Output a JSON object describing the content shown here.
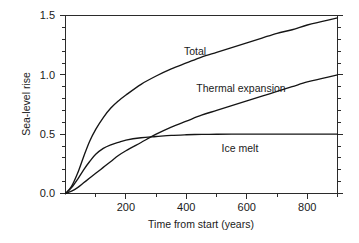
{
  "chart_data": {
    "type": "line",
    "title": "",
    "xlabel": "Time from start (years)",
    "ylabel": "Sea-level rise",
    "xlim": [
      0,
      900
    ],
    "ylim": [
      0.0,
      1.5
    ],
    "grid": false,
    "legend_position": "inline-annotations",
    "x_ticks": [
      200,
      400,
      600,
      800
    ],
    "x_tick_labels": [
      "200",
      "400",
      "600",
      "800"
    ],
    "x_minor_ticks": [
      100,
      300,
      500,
      700,
      900
    ],
    "y_ticks": [
      0.0,
      0.5,
      1.0,
      1.5
    ],
    "y_tick_labels": [
      "0.0",
      "0.5",
      "1.0",
      "1.5"
    ],
    "y_minor_ticks": [
      0.1,
      0.2,
      0.3,
      0.4,
      0.6,
      0.7,
      0.8,
      0.9,
      1.1,
      1.2,
      1.3,
      1.4
    ],
    "x": [
      0,
      20,
      40,
      60,
      80,
      100,
      125,
      150,
      175,
      200,
      250,
      300,
      350,
      400,
      450,
      500,
      550,
      600,
      650,
      700,
      750,
      800,
      850,
      900
    ],
    "series": [
      {
        "name": "Total",
        "label": "Total",
        "color": "#151515",
        "values": [
          0.0,
          0.06,
          0.17,
          0.31,
          0.44,
          0.54,
          0.64,
          0.72,
          0.78,
          0.83,
          0.92,
          0.99,
          1.05,
          1.1,
          1.15,
          1.19,
          1.23,
          1.27,
          1.31,
          1.35,
          1.38,
          1.42,
          1.45,
          1.48
        ]
      },
      {
        "name": "Thermal expansion",
        "label": "Thermal expansion",
        "color": "#151515",
        "values": [
          0.0,
          0.02,
          0.05,
          0.09,
          0.13,
          0.17,
          0.22,
          0.27,
          0.32,
          0.36,
          0.43,
          0.5,
          0.56,
          0.61,
          0.66,
          0.7,
          0.74,
          0.78,
          0.82,
          0.86,
          0.9,
          0.94,
          0.97,
          1.0
        ]
      },
      {
        "name": "Ice melt",
        "label": "Ice melt",
        "color": "#151515",
        "values": [
          0.0,
          0.05,
          0.12,
          0.2,
          0.27,
          0.33,
          0.38,
          0.41,
          0.43,
          0.45,
          0.47,
          0.48,
          0.49,
          0.495,
          0.498,
          0.499,
          0.5,
          0.5,
          0.5,
          0.5,
          0.5,
          0.5,
          0.5,
          0.5
        ]
      }
    ],
    "annotations": [
      {
        "text": "Total",
        "x": 430,
        "y": 1.29
      },
      {
        "text": "Thermal expansion",
        "x": 530,
        "y": 0.93
      },
      {
        "text": "Ice melt",
        "x": 580,
        "y": 0.41
      }
    ]
  }
}
